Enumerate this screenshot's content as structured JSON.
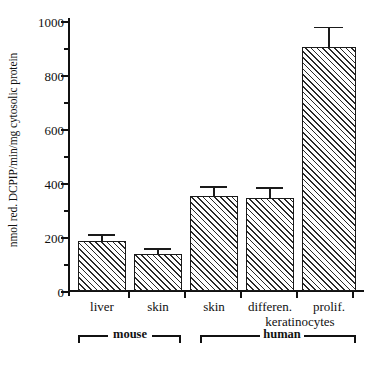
{
  "chart_data": {
    "type": "bar",
    "title": "",
    "xlabel": "",
    "ylabel": "nmol red. DCPIP/min/mg cytosolic protein",
    "ylim": [
      0,
      1000
    ],
    "yticks": [
      0,
      200,
      400,
      600,
      800,
      1000
    ],
    "ytick_labels": [
      "0",
      "200",
      "400",
      "600",
      "800",
      "1000"
    ],
    "minor_ticks": [
      100,
      300,
      500,
      700,
      900
    ],
    "grid": false,
    "legend": null,
    "categories": [
      "liver",
      "skin",
      "skin",
      "differen.",
      "prolif."
    ],
    "values": [
      185,
      137,
      353,
      345,
      903
    ],
    "errors": [
      18,
      14,
      30,
      32,
      70
    ],
    "bar_style": {
      "fill": "diagonal-hatch",
      "edge_color": "#1a1a1a",
      "face_color": "#ffffff"
    },
    "annotations": [
      {
        "text": "keratinocytes",
        "applies_to": [
          "differen.",
          "prolif."
        ]
      }
    ],
    "groups": [
      {
        "label": "mouse",
        "categories": [
          "liver",
          "skin"
        ]
      },
      {
        "label": "human",
        "categories": [
          "skin",
          "differen.",
          "prolif."
        ]
      }
    ]
  },
  "axis": {
    "y_title": "nmol red. DCPIP/min/mg cytosolic protein",
    "tick_1000": "1000",
    "tick_800": "800",
    "tick_600": "600",
    "tick_400": "400",
    "tick_200": "200",
    "tick_0": "0"
  },
  "xlabels": {
    "c0": "liver",
    "c1": "skin",
    "c2": "skin",
    "c3": "differen.",
    "c4": "prolif.",
    "keratinocytes": "keratinocytes"
  },
  "groups": {
    "mouse": "mouse",
    "human": "human"
  },
  "colors": {
    "ink": "#111111",
    "bar_edge": "#1a1a1a",
    "bar_hatch": "#2a2a2a",
    "background": "#ffffff"
  }
}
